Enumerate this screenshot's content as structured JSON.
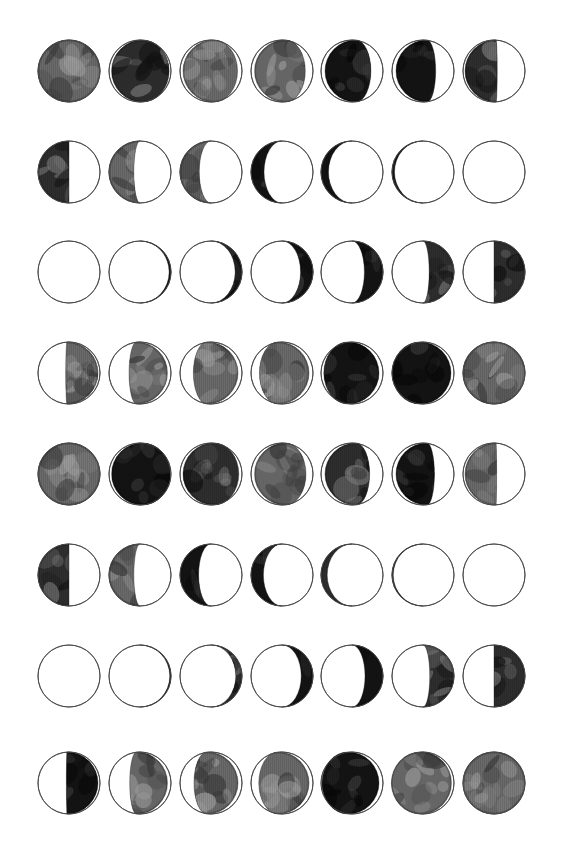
{
  "page": {
    "background_color": "#ffffff",
    "width": 581,
    "height": 859
  },
  "grid": {
    "columns": 7,
    "rows": 8,
    "total_cells": 56,
    "cell_diameter": 62,
    "column_spacing": 71,
    "row_spacing": 100,
    "first_column_center_x": 69,
    "first_row_center_y": 71
  },
  "style": {
    "outline_color": "#4a4a4a",
    "outline_width": 0.9,
    "unlit_fill": "#ffffff",
    "lit_base_color": "#6a6a6a",
    "lit_dark_color": "#141414",
    "maria_light": "#9c9c9c",
    "maria_dark": "#3a3a3a",
    "shadow_black": "#080808",
    "scanline_color": "#00000022"
  },
  "legend": {
    "convention": "textured-grey-is-illuminated",
    "unlit_note": "unlit portion drawn as plain white with thin outline",
    "lit_note": "illuminated portion drawn with mottled lunar surface texture"
  },
  "moons": [
    {
      "id": "r1c1",
      "row": 1,
      "col": 1,
      "cx": 69,
      "cy": 71,
      "illum": 1.0,
      "lit_side": "full",
      "tone": "mid",
      "offset": 0.0,
      "phase_name": "full-moon"
    },
    {
      "id": "r1c2",
      "row": 1,
      "col": 2,
      "cx": 140,
      "cy": 71,
      "illum": 0.93,
      "lit_side": "left",
      "tone": "dark",
      "offset": 2.5,
      "phase_name": "waning-gibbous"
    },
    {
      "id": "r1c3",
      "row": 1,
      "col": 3,
      "cx": 211,
      "cy": 71,
      "illum": 0.88,
      "lit_side": "left",
      "tone": "mid",
      "offset": 3.0,
      "phase_name": "waning-gibbous"
    },
    {
      "id": "r1c4",
      "row": 1,
      "col": 4,
      "cx": 282,
      "cy": 71,
      "illum": 0.82,
      "lit_side": "left",
      "tone": "mid",
      "offset": 3.5,
      "phase_name": "waning-gibbous"
    },
    {
      "id": "r1c5",
      "row": 1,
      "col": 5,
      "cx": 352,
      "cy": 71,
      "illum": 0.74,
      "lit_side": "left",
      "tone": "verydark",
      "offset": 4.0,
      "phase_name": "waning-gibbous"
    },
    {
      "id": "r1c6",
      "row": 1,
      "col": 6,
      "cx": 423,
      "cy": 71,
      "illum": 0.64,
      "lit_side": "left",
      "tone": "verydark",
      "offset": 4.0,
      "phase_name": "waning-gibbous"
    },
    {
      "id": "r1c7",
      "row": 1,
      "col": 7,
      "cx": 494,
      "cy": 71,
      "illum": 0.52,
      "lit_side": "left",
      "tone": "dark",
      "offset": 2.0,
      "phase_name": "last-quarter"
    },
    {
      "id": "r2c1",
      "row": 2,
      "col": 1,
      "cx": 69,
      "cy": 172,
      "illum": 0.5,
      "lit_side": "left",
      "tone": "dark",
      "offset": 0.0,
      "phase_name": "last-quarter"
    },
    {
      "id": "r2c2",
      "row": 2,
      "col": 2,
      "cx": 140,
      "cy": 172,
      "illum": 0.4,
      "lit_side": "left",
      "tone": "mid",
      "offset": 0.0,
      "phase_name": "waning-crescent"
    },
    {
      "id": "r2c3",
      "row": 2,
      "col": 3,
      "cx": 211,
      "cy": 172,
      "illum": 0.31,
      "lit_side": "left",
      "tone": "mid",
      "offset": 0.0,
      "phase_name": "waning-crescent"
    },
    {
      "id": "r2c4",
      "row": 2,
      "col": 4,
      "cx": 282,
      "cy": 172,
      "illum": 0.21,
      "lit_side": "left",
      "tone": "verydark",
      "offset": 0.0,
      "phase_name": "waning-crescent"
    },
    {
      "id": "r2c5",
      "row": 2,
      "col": 5,
      "cx": 352,
      "cy": 172,
      "illum": 0.12,
      "lit_side": "left",
      "tone": "verydark",
      "offset": 0.0,
      "phase_name": "waning-crescent"
    },
    {
      "id": "r2c6",
      "row": 2,
      "col": 6,
      "cx": 423,
      "cy": 172,
      "illum": 0.04,
      "lit_side": "left",
      "tone": "verydark",
      "offset": 0.0,
      "phase_name": "waning-crescent"
    },
    {
      "id": "r2c7",
      "row": 2,
      "col": 7,
      "cx": 494,
      "cy": 172,
      "illum": 0.0,
      "lit_side": "none",
      "tone": "none",
      "offset": 0.0,
      "phase_name": "new-moon"
    },
    {
      "id": "r3c1",
      "row": 3,
      "col": 1,
      "cx": 69,
      "cy": 272,
      "illum": 0.0,
      "lit_side": "none",
      "tone": "none",
      "offset": 0.0,
      "phase_name": "new-moon"
    },
    {
      "id": "r3c2",
      "row": 3,
      "col": 2,
      "cx": 140,
      "cy": 272,
      "illum": 0.03,
      "lit_side": "right",
      "tone": "verydark",
      "offset": 0.0,
      "phase_name": "waxing-crescent"
    },
    {
      "id": "r3c3",
      "row": 3,
      "col": 3,
      "cx": 211,
      "cy": 272,
      "illum": 0.11,
      "lit_side": "right",
      "tone": "verydark",
      "offset": 0.0,
      "phase_name": "waxing-crescent"
    },
    {
      "id": "r3c4",
      "row": 3,
      "col": 4,
      "cx": 282,
      "cy": 272,
      "illum": 0.2,
      "lit_side": "right",
      "tone": "verydark",
      "offset": 0.0,
      "phase_name": "waxing-crescent"
    },
    {
      "id": "r3c5",
      "row": 3,
      "col": 5,
      "cx": 352,
      "cy": 272,
      "illum": 0.3,
      "lit_side": "right",
      "tone": "verydark",
      "offset": 0.0,
      "phase_name": "waxing-crescent"
    },
    {
      "id": "r3c6",
      "row": 3,
      "col": 6,
      "cx": 423,
      "cy": 272,
      "illum": 0.4,
      "lit_side": "right",
      "tone": "dark",
      "offset": 0.0,
      "phase_name": "waxing-crescent"
    },
    {
      "id": "r3c7",
      "row": 3,
      "col": 7,
      "cx": 494,
      "cy": 272,
      "illum": 0.5,
      "lit_side": "right",
      "tone": "dark",
      "offset": 0.0,
      "phase_name": "first-quarter"
    },
    {
      "id": "r4c1",
      "row": 4,
      "col": 1,
      "cx": 69,
      "cy": 373,
      "illum": 0.52,
      "lit_side": "right",
      "tone": "mid",
      "offset": -2.0,
      "phase_name": "first-quarter"
    },
    {
      "id": "r4c2",
      "row": 4,
      "col": 2,
      "cx": 140,
      "cy": 373,
      "illum": 0.62,
      "lit_side": "right",
      "tone": "mid",
      "offset": -3.5,
      "phase_name": "waxing-gibbous"
    },
    {
      "id": "r4c3",
      "row": 4,
      "col": 3,
      "cx": 211,
      "cy": 373,
      "illum": 0.72,
      "lit_side": "right",
      "tone": "mid",
      "offset": -4.0,
      "phase_name": "waxing-gibbous"
    },
    {
      "id": "r4c4",
      "row": 4,
      "col": 4,
      "cx": 282,
      "cy": 373,
      "illum": 0.8,
      "lit_side": "right",
      "tone": "mid",
      "offset": -4.0,
      "phase_name": "waxing-gibbous"
    },
    {
      "id": "r4c5",
      "row": 4,
      "col": 5,
      "cx": 352,
      "cy": 373,
      "illum": 0.89,
      "lit_side": "right",
      "tone": "verydark",
      "offset": -4.0,
      "phase_name": "waxing-gibbous"
    },
    {
      "id": "r4c6",
      "row": 4,
      "col": 6,
      "cx": 423,
      "cy": 373,
      "illum": 0.95,
      "lit_side": "right",
      "tone": "verydark",
      "offset": -3.0,
      "phase_name": "waxing-gibbous"
    },
    {
      "id": "r4c7",
      "row": 4,
      "col": 7,
      "cx": 494,
      "cy": 373,
      "illum": 1.0,
      "lit_side": "full",
      "tone": "mid",
      "offset": 0.0,
      "phase_name": "full-moon"
    },
    {
      "id": "r5c1",
      "row": 5,
      "col": 1,
      "cx": 69,
      "cy": 474,
      "illum": 1.0,
      "lit_side": "full",
      "tone": "mid",
      "offset": 0.0,
      "phase_name": "full-moon"
    },
    {
      "id": "r5c2",
      "row": 5,
      "col": 2,
      "cx": 140,
      "cy": 474,
      "illum": 0.95,
      "lit_side": "left",
      "tone": "verydark",
      "offset": 2.5,
      "phase_name": "waning-gibbous"
    },
    {
      "id": "r5c3",
      "row": 5,
      "col": 3,
      "cx": 211,
      "cy": 474,
      "illum": 0.9,
      "lit_side": "left",
      "tone": "dark",
      "offset": 3.0,
      "phase_name": "waning-gibbous"
    },
    {
      "id": "r5c4",
      "row": 5,
      "col": 4,
      "cx": 282,
      "cy": 474,
      "illum": 0.83,
      "lit_side": "left",
      "tone": "mid",
      "offset": 3.5,
      "phase_name": "waning-gibbous"
    },
    {
      "id": "r5c5",
      "row": 5,
      "col": 5,
      "cx": 352,
      "cy": 474,
      "illum": 0.72,
      "lit_side": "left",
      "tone": "dark",
      "offset": 4.0,
      "phase_name": "waning-gibbous"
    },
    {
      "id": "r5c6",
      "row": 5,
      "col": 6,
      "cx": 423,
      "cy": 474,
      "illum": 0.62,
      "lit_side": "left",
      "tone": "verydark",
      "offset": 4.0,
      "phase_name": "waning-gibbous"
    },
    {
      "id": "r5c7",
      "row": 5,
      "col": 7,
      "cx": 494,
      "cy": 474,
      "illum": 0.51,
      "lit_side": "left",
      "tone": "mid",
      "offset": 2.0,
      "phase_name": "last-quarter"
    },
    {
      "id": "r6c1",
      "row": 6,
      "col": 1,
      "cx": 69,
      "cy": 575,
      "illum": 0.5,
      "lit_side": "left",
      "tone": "dark",
      "offset": 0.0,
      "phase_name": "last-quarter"
    },
    {
      "id": "r6c2",
      "row": 6,
      "col": 2,
      "cx": 140,
      "cy": 575,
      "illum": 0.4,
      "lit_side": "left",
      "tone": "mid",
      "offset": 0.0,
      "phase_name": "waning-crescent"
    },
    {
      "id": "r6c3",
      "row": 6,
      "col": 3,
      "cx": 211,
      "cy": 575,
      "illum": 0.3,
      "lit_side": "left",
      "tone": "verydark",
      "offset": 0.0,
      "phase_name": "waning-crescent"
    },
    {
      "id": "r6c4",
      "row": 6,
      "col": 4,
      "cx": 282,
      "cy": 575,
      "illum": 0.2,
      "lit_side": "left",
      "tone": "verydark",
      "offset": 0.0,
      "phase_name": "waning-crescent"
    },
    {
      "id": "r6c5",
      "row": 6,
      "col": 5,
      "cx": 352,
      "cy": 575,
      "illum": 0.1,
      "lit_side": "left",
      "tone": "dark",
      "offset": 0.0,
      "phase_name": "waning-crescent"
    },
    {
      "id": "r6c6",
      "row": 6,
      "col": 6,
      "cx": 423,
      "cy": 575,
      "illum": 0.02,
      "lit_side": "left",
      "tone": "dark",
      "offset": 0.0,
      "phase_name": "waning-crescent"
    },
    {
      "id": "r6c7",
      "row": 6,
      "col": 7,
      "cx": 494,
      "cy": 575,
      "illum": 0.0,
      "lit_side": "none",
      "tone": "none",
      "offset": 0.0,
      "phase_name": "new-moon"
    },
    {
      "id": "r7c1",
      "row": 7,
      "col": 1,
      "cx": 69,
      "cy": 676,
      "illum": 0.0,
      "lit_side": "none",
      "tone": "none",
      "offset": 0.0,
      "phase_name": "new-moon"
    },
    {
      "id": "r7c2",
      "row": 7,
      "col": 2,
      "cx": 140,
      "cy": 676,
      "illum": 0.02,
      "lit_side": "right",
      "tone": "verydark",
      "offset": 0.0,
      "phase_name": "waxing-crescent"
    },
    {
      "id": "r7c3",
      "row": 7,
      "col": 3,
      "cx": 211,
      "cy": 676,
      "illum": 0.1,
      "lit_side": "right",
      "tone": "dark",
      "offset": 0.0,
      "phase_name": "waxing-crescent"
    },
    {
      "id": "r7c4",
      "row": 7,
      "col": 4,
      "cx": 282,
      "cy": 676,
      "illum": 0.19,
      "lit_side": "right",
      "tone": "verydark",
      "offset": 0.0,
      "phase_name": "waxing-crescent"
    },
    {
      "id": "r7c5",
      "row": 7,
      "col": 5,
      "cx": 352,
      "cy": 676,
      "illum": 0.29,
      "lit_side": "right",
      "tone": "verydark",
      "offset": 0.0,
      "phase_name": "waxing-crescent"
    },
    {
      "id": "r7c6",
      "row": 7,
      "col": 6,
      "cx": 423,
      "cy": 676,
      "illum": 0.39,
      "lit_side": "right",
      "tone": "dark",
      "offset": 0.0,
      "phase_name": "waxing-crescent"
    },
    {
      "id": "r7c7",
      "row": 7,
      "col": 7,
      "cx": 494,
      "cy": 676,
      "illum": 0.5,
      "lit_side": "right",
      "tone": "dark",
      "offset": 0.0,
      "phase_name": "first-quarter"
    },
    {
      "id": "r8c1",
      "row": 8,
      "col": 1,
      "cx": 69,
      "cy": 783,
      "illum": 0.51,
      "lit_side": "right",
      "tone": "verydark",
      "offset": -2.0,
      "phase_name": "first-quarter"
    },
    {
      "id": "r8c2",
      "row": 8,
      "col": 2,
      "cx": 140,
      "cy": 783,
      "illum": 0.61,
      "lit_side": "right",
      "tone": "mid",
      "offset": -3.5,
      "phase_name": "waxing-gibbous"
    },
    {
      "id": "r8c3",
      "row": 8,
      "col": 3,
      "cx": 211,
      "cy": 783,
      "illum": 0.71,
      "lit_side": "right",
      "tone": "mid",
      "offset": -4.0,
      "phase_name": "waxing-gibbous"
    },
    {
      "id": "r8c4",
      "row": 8,
      "col": 4,
      "cx": 282,
      "cy": 783,
      "illum": 0.81,
      "lit_side": "right",
      "tone": "mid",
      "offset": -4.0,
      "phase_name": "waxing-gibbous"
    },
    {
      "id": "r8c5",
      "row": 8,
      "col": 5,
      "cx": 352,
      "cy": 783,
      "illum": 0.92,
      "lit_side": "right",
      "tone": "verydark",
      "offset": -4.0,
      "phase_name": "waxing-gibbous"
    },
    {
      "id": "r8c6",
      "row": 8,
      "col": 6,
      "cx": 423,
      "cy": 783,
      "illum": 0.97,
      "lit_side": "right",
      "tone": "mid",
      "offset": -2.5,
      "phase_name": "waxing-gibbous"
    },
    {
      "id": "r8c7",
      "row": 8,
      "col": 7,
      "cx": 494,
      "cy": 783,
      "illum": 1.0,
      "lit_side": "full",
      "tone": "mid",
      "offset": 0.0,
      "phase_name": "full-moon"
    }
  ]
}
